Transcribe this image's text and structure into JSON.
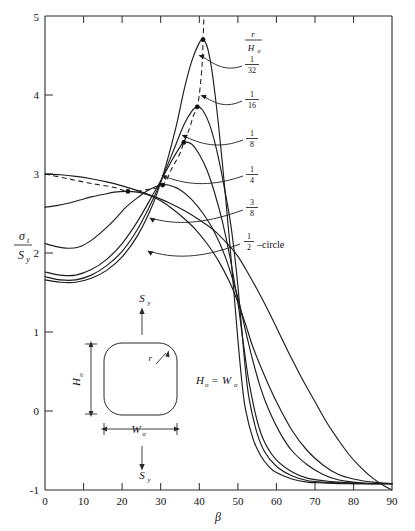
{
  "chart_data": {
    "type": "line",
    "title": "",
    "xlabel": "β",
    "ylabel_numerator": "σ",
    "ylabel_num_sub": "t",
    "ylabel_denominator": "S",
    "ylabel_den_sub": "y",
    "xlim": [
      0,
      90
    ],
    "ylim": [
      -1,
      5
    ],
    "xticks": [
      0,
      10,
      20,
      30,
      40,
      50,
      60,
      70,
      80,
      90
    ],
    "xticklabels": [
      "0",
      "10",
      "20",
      "30",
      "40",
      "50",
      "60",
      "70",
      "80",
      "90"
    ],
    "yticks": [
      -1,
      0,
      1,
      2,
      3,
      4,
      5
    ],
    "yticklabels": [
      "-1",
      "0",
      "1",
      "2",
      "3",
      "4",
      "5"
    ],
    "grid": false,
    "legend_position": "inline-right-annotations",
    "series": [
      {
        "name": "r/Ho = 1/32",
        "label_numerator": "1",
        "label_denominator": "32",
        "peak": {
          "x": 41.0,
          "y": 4.7
        },
        "points": [
          [
            0,
            1.66
          ],
          [
            4,
            1.63
          ],
          [
            8,
            1.63
          ],
          [
            12,
            1.68
          ],
          [
            16,
            1.78
          ],
          [
            20,
            1.95
          ],
          [
            24,
            2.22
          ],
          [
            28,
            2.62
          ],
          [
            31,
            3.05
          ],
          [
            34,
            3.6
          ],
          [
            36,
            4.05
          ],
          [
            38,
            4.42
          ],
          [
            40,
            4.66
          ],
          [
            41,
            4.7
          ],
          [
            42,
            4.62
          ],
          [
            43,
            4.4
          ],
          [
            44,
            4.05
          ],
          [
            45,
            3.62
          ],
          [
            46,
            3.14
          ],
          [
            47,
            2.62
          ],
          [
            48,
            2.08
          ],
          [
            49,
            1.5
          ],
          [
            50,
            0.92
          ],
          [
            51,
            0.4
          ],
          [
            52,
            0.02
          ],
          [
            54,
            -0.36
          ],
          [
            56,
            -0.57
          ],
          [
            58,
            -0.7
          ],
          [
            60,
            -0.78
          ],
          [
            64,
            -0.86
          ],
          [
            68,
            -0.9
          ],
          [
            72,
            -0.91
          ],
          [
            76,
            -0.92
          ],
          [
            80,
            -0.92
          ],
          [
            85,
            -0.92
          ],
          [
            90,
            -0.92
          ]
        ]
      },
      {
        "name": "r/Ho = 1/16",
        "label_numerator": "1",
        "label_denominator": "16",
        "peak": {
          "x": 39.5,
          "y": 3.85
        },
        "points": [
          [
            0,
            1.7
          ],
          [
            4,
            1.66
          ],
          [
            8,
            1.66
          ],
          [
            12,
            1.72
          ],
          [
            16,
            1.84
          ],
          [
            20,
            2.02
          ],
          [
            24,
            2.3
          ],
          [
            28,
            2.68
          ],
          [
            31,
            3.02
          ],
          [
            34,
            3.38
          ],
          [
            36,
            3.62
          ],
          [
            38,
            3.79
          ],
          [
            39.5,
            3.85
          ],
          [
            41,
            3.8
          ],
          [
            43,
            3.58
          ],
          [
            45,
            3.2
          ],
          [
            47,
            2.7
          ],
          [
            48,
            2.42
          ],
          [
            49,
            2.05
          ],
          [
            50,
            1.6
          ],
          [
            51,
            1.05
          ],
          [
            52,
            0.52
          ],
          [
            53,
            0.14
          ],
          [
            55,
            -0.28
          ],
          [
            57,
            -0.52
          ],
          [
            60,
            -0.7
          ],
          [
            64,
            -0.82
          ],
          [
            68,
            -0.88
          ],
          [
            72,
            -0.9
          ],
          [
            76,
            -0.91
          ],
          [
            80,
            -0.92
          ],
          [
            85,
            -0.92
          ],
          [
            90,
            -0.92
          ]
        ]
      },
      {
        "name": "r/Ho = 1/8",
        "label_numerator": "1",
        "label_denominator": "8",
        "peak": {
          "x": 36.0,
          "y": 3.4
        },
        "points": [
          [
            0,
            1.76
          ],
          [
            4,
            1.72
          ],
          [
            8,
            1.72
          ],
          [
            12,
            1.79
          ],
          [
            16,
            1.92
          ],
          [
            20,
            2.12
          ],
          [
            24,
            2.4
          ],
          [
            28,
            2.74
          ],
          [
            31,
            3.0
          ],
          [
            33,
            3.18
          ],
          [
            35,
            3.34
          ],
          [
            36,
            3.4
          ],
          [
            38,
            3.38
          ],
          [
            40,
            3.25
          ],
          [
            42,
            3.05
          ],
          [
            44,
            2.76
          ],
          [
            46,
            2.4
          ],
          [
            48,
            1.94
          ],
          [
            50,
            1.38
          ],
          [
            51,
            1.02
          ],
          [
            52,
            0.66
          ],
          [
            53,
            0.34
          ],
          [
            55,
            -0.12
          ],
          [
            57,
            -0.4
          ],
          [
            60,
            -0.62
          ],
          [
            64,
            -0.77
          ],
          [
            68,
            -0.85
          ],
          [
            72,
            -0.88
          ],
          [
            76,
            -0.9
          ],
          [
            80,
            -0.91
          ],
          [
            85,
            -0.92
          ],
          [
            90,
            -0.92
          ]
        ]
      },
      {
        "name": "r/Ho = 1/4",
        "label_numerator": "1",
        "label_denominator": "4",
        "peak": {
          "x": 30.5,
          "y": 2.86
        },
        "points": [
          [
            0,
            2.12
          ],
          [
            3,
            2.08
          ],
          [
            6,
            2.06
          ],
          [
            9,
            2.08
          ],
          [
            12,
            2.16
          ],
          [
            15,
            2.28
          ],
          [
            18,
            2.42
          ],
          [
            21,
            2.58
          ],
          [
            24,
            2.7
          ],
          [
            27,
            2.8
          ],
          [
            30,
            2.86
          ],
          [
            32,
            2.86
          ],
          [
            35,
            2.8
          ],
          [
            38,
            2.68
          ],
          [
            41,
            2.5
          ],
          [
            44,
            2.26
          ],
          [
            47,
            1.92
          ],
          [
            50,
            1.44
          ],
          [
            52,
            1.02
          ],
          [
            54,
            0.62
          ],
          [
            56,
            0.28
          ],
          [
            58,
            0.02
          ],
          [
            61,
            -0.28
          ],
          [
            64,
            -0.5
          ],
          [
            68,
            -0.68
          ],
          [
            72,
            -0.8
          ],
          [
            76,
            -0.87
          ],
          [
            80,
            -0.9
          ],
          [
            85,
            -0.92
          ],
          [
            90,
            -0.92
          ]
        ]
      },
      {
        "name": "r/Ho = 3/8",
        "label_numerator": "3",
        "label_denominator": "8",
        "peak": {
          "x": 21.5,
          "y": 2.78
        },
        "points": [
          [
            0,
            2.58
          ],
          [
            3,
            2.6
          ],
          [
            6,
            2.63
          ],
          [
            9,
            2.67
          ],
          [
            12,
            2.71
          ],
          [
            15,
            2.74
          ],
          [
            18,
            2.77
          ],
          [
            21,
            2.78
          ],
          [
            24,
            2.77
          ],
          [
            27,
            2.73
          ],
          [
            30,
            2.66
          ],
          [
            33,
            2.56
          ],
          [
            36,
            2.44
          ],
          [
            39,
            2.3
          ],
          [
            42,
            2.12
          ],
          [
            45,
            1.9
          ],
          [
            48,
            1.62
          ],
          [
            50,
            1.38
          ],
          [
            52,
            1.1
          ],
          [
            54,
            0.8
          ],
          [
            57,
            0.44
          ],
          [
            60,
            0.12
          ],
          [
            64,
            -0.24
          ],
          [
            68,
            -0.5
          ],
          [
            72,
            -0.68
          ],
          [
            76,
            -0.8
          ],
          [
            80,
            -0.86
          ],
          [
            85,
            -0.9
          ],
          [
            90,
            -0.92
          ]
        ]
      },
      {
        "name": "1/2 - circle",
        "label_numerator": "1",
        "label_denominator": "2",
        "label_suffix": "–circle",
        "peak": {
          "x": 0,
          "y": 3.0
        },
        "points": [
          [
            0,
            3.0
          ],
          [
            4,
            2.99
          ],
          [
            8,
            2.97
          ],
          [
            12,
            2.94
          ],
          [
            16,
            2.9
          ],
          [
            20,
            2.85
          ],
          [
            24,
            2.79
          ],
          [
            28,
            2.72
          ],
          [
            32,
            2.64
          ],
          [
            36,
            2.54
          ],
          [
            40,
            2.42
          ],
          [
            44,
            2.28
          ],
          [
            48,
            2.08
          ],
          [
            50,
            1.96
          ],
          [
            52,
            1.8
          ],
          [
            55,
            1.54
          ],
          [
            58,
            1.26
          ],
          [
            61,
            0.96
          ],
          [
            64,
            0.66
          ],
          [
            67,
            0.38
          ],
          [
            70,
            0.12
          ],
          [
            73,
            -0.14
          ],
          [
            76,
            -0.36
          ],
          [
            79,
            -0.56
          ],
          [
            82,
            -0.72
          ],
          [
            85,
            -0.85
          ],
          [
            88,
            -0.95
          ],
          [
            90,
            -1.0
          ]
        ]
      }
    ],
    "envelope": {
      "name": "peak-locus",
      "dashed": true,
      "points": [
        [
          0,
          3.0
        ],
        [
          6,
          2.94
        ],
        [
          12,
          2.88
        ],
        [
          18,
          2.83
        ],
        [
          21.5,
          2.78
        ],
        [
          26,
          2.8
        ],
        [
          30.5,
          2.86
        ],
        [
          33,
          3.08
        ],
        [
          35,
          3.26
        ],
        [
          36,
          3.4
        ],
        [
          37.5,
          3.58
        ],
        [
          38.5,
          3.74
        ],
        [
          39.5,
          3.85
        ],
        [
          40.2,
          4.08
        ],
        [
          40.8,
          4.42
        ],
        [
          41,
          4.7
        ],
        [
          41.2,
          4.96
        ]
      ]
    },
    "annotations": {
      "ratio_label_numerator": "r",
      "ratio_label_denominator": "H",
      "ratio_label_den_sub": "o"
    }
  },
  "inset": {
    "stress_top_label": "S",
    "stress_top_sub": "y",
    "stress_bottom_label": "S",
    "stress_bottom_sub": "y",
    "height_label": "H",
    "height_sub": "o",
    "width_label": "W",
    "width_sub": "o",
    "radius_label": "r",
    "equality_left": "H",
    "equality_left_sub": "o",
    "equality_op": "=",
    "equality_right": "W",
    "equality_right_sub": "o"
  },
  "colors": {
    "ink": "#1d1d1d",
    "background": "#ffffff"
  }
}
